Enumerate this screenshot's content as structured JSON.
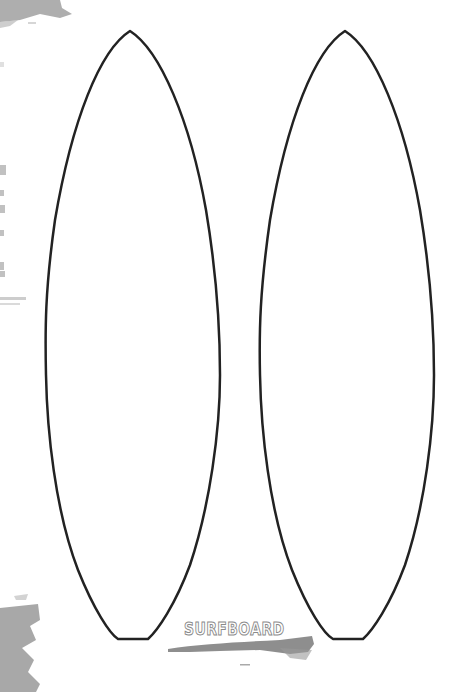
{
  "title_label": "SURFBOARD",
  "colors": {
    "background": "#ffffff",
    "outline": "#222222",
    "brush": "#8a8a8a",
    "label_outline": "#8a8a8a"
  },
  "boards": [
    {
      "name": "left-surfboard",
      "tip": [
        130,
        31
      ],
      "left_rail_x": 45,
      "right_rail_x": 220,
      "widest_y": 375,
      "tail_left": [
        118,
        639
      ],
      "tail_right": [
        148,
        639
      ]
    },
    {
      "name": "right-surfboard",
      "tip": [
        345,
        31
      ],
      "left_rail_x": 259,
      "right_rail_x": 434,
      "widest_y": 375,
      "tail_left": [
        333,
        639
      ],
      "tail_right": [
        363,
        639
      ]
    }
  ]
}
